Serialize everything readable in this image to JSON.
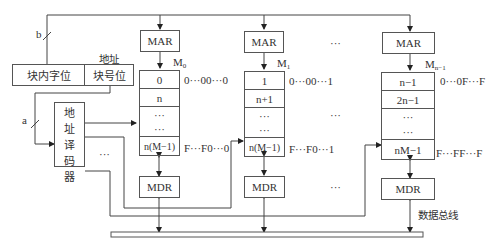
{
  "address": {
    "title": "地址",
    "word_in_block": "块内字位",
    "block_no": "块号位",
    "line_b": "b",
    "line_a": "a"
  },
  "decoder": {
    "chars": [
      "地",
      "址",
      "译",
      "码",
      "器"
    ],
    "ellipsis": "···"
  },
  "modules": [
    {
      "name": "M",
      "sub": "0",
      "mar": "MAR",
      "mdr": "MDR",
      "cells": [
        "0",
        "n",
        "···",
        "···",
        "n(M−1)"
      ],
      "first_addr": "0···00···0",
      "last_addr": "F···F0···0"
    },
    {
      "name": "M",
      "sub": "1",
      "mar": "MAR",
      "mdr": "MDR",
      "cells": [
        "1",
        "n+1",
        "···",
        "···",
        "n(M−1)"
      ],
      "first_addr": "0···00···1",
      "last_addr": "F···F0···1"
    },
    {
      "name": "M",
      "sub": "n−1",
      "mar": "MAR",
      "mdr": "MDR",
      "cells": [
        "n−1",
        "2n−1",
        "···",
        "···",
        "nM−1"
      ],
      "first_addr": "0···0F···F",
      "last_addr": "F···FF···F"
    }
  ],
  "between_ellipsis": [
    "···",
    "···",
    "···"
  ],
  "bus_label": "数据总线"
}
